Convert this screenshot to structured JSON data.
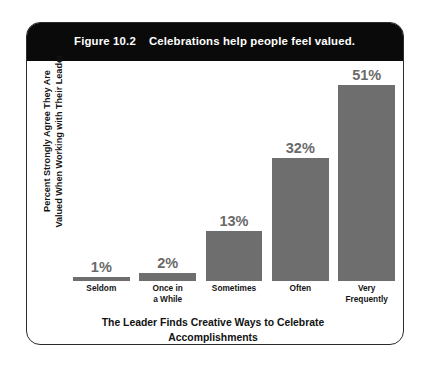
{
  "figure": {
    "number": "Figure 10.2",
    "title": "Celebrations help people feel valued."
  },
  "axis": {
    "ylabel_line1": "Percent Strongly Agree They Are",
    "ylabel_line2": "Valued When Working with Their Leader",
    "xlabel_line1": "The Leader Finds Creative Ways to Celebrate",
    "xlabel_line2": "Accomplishments"
  },
  "colors": {
    "bar_fill": "#6e6e6e",
    "header_bg": "#0a0a0a",
    "header_text": "#ffffff",
    "value_label": "#6a6a6a",
    "frame_border": "#2b2b2b"
  },
  "chart_data": {
    "type": "bar",
    "title": "Celebrations help people feel valued.",
    "categories": [
      "Seldom",
      "Once in a While",
      "Sometimes",
      "Often",
      "Very Frequently"
    ],
    "category_lines": [
      [
        "Seldom"
      ],
      [
        "Once in",
        "a While"
      ],
      [
        "Sometimes"
      ],
      [
        "Often"
      ],
      [
        "Very",
        "Frequently"
      ]
    ],
    "values": [
      1,
      2,
      13,
      32,
      51
    ],
    "value_labels": [
      "1%",
      "2%",
      "13%",
      "32%",
      "51%"
    ],
    "xlabel": "The Leader Finds Creative Ways to Celebrate Accomplishments",
    "ylabel": "Percent Strongly Agree They Are Valued When Working with Their Leader",
    "ylim": [
      0,
      57
    ],
    "grid": false,
    "legend": "none",
    "units": "percent"
  }
}
